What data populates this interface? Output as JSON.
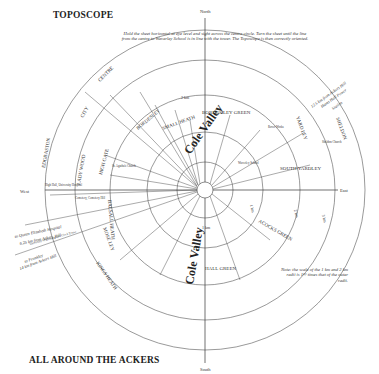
{
  "title": "TOPOSCOPE",
  "footer_title": "ALL AROUND THE ACKERS",
  "instructions": "Hold the sheet horizontal at eye level and sight across the centre circle. Turn the sheet until the line from the centre to Waverley School is in line with the tower. The Toposcope is then correctly oriented.",
  "note": "Note: the scale of the 1 km and 2 km radii is 1½ times that of the outer radii.",
  "compass": {
    "north": "North",
    "south": "South",
    "east": "East",
    "west": "West"
  },
  "rings": {
    "r1": "1 km",
    "r2": "2 km",
    "r3": "3 km",
    "r4": "4 km"
  },
  "districts": {
    "centre": "CENTRE",
    "city": "CITY",
    "edgbaston": "EDGBASTON",
    "ladywood": "LADY WOOD",
    "highgate": "HIGH GATE",
    "balsall_heath": "BALSALL HEATH",
    "moseley": "MOSE LEY",
    "kings_heath": "KINGS HEATH",
    "digbeth": "DIGBETH",
    "bordesley_green": "BORDES LEY GREEN",
    "small_heath": "SMALL HEATH",
    "bordesley": "BORDESLEY",
    "yardley": "YARD LEY",
    "south_yardley": "SOUTH YARDLEY",
    "sheldon": "SHELDON",
    "acocks_green": "ACOCKS GREEN",
    "hall_green": "HALL GREEN"
  },
  "river_labels": [
    "Cole Valley",
    "Cole Valley"
  ],
  "pointers": {
    "qe_hospital": [
      "to Queen Elizabeth Hospital",
      "6.25 km from Ackers Hill"
    ],
    "frankley": [
      "to Frankley",
      "14 km from Ackers Hill"
    ],
    "hams_hall": [
      "12.5 km from Ackers Hill",
      "Hams Hall Power",
      "Station"
    ]
  },
  "landmarks": {
    "high_hall": "High Hall, University Hospital",
    "cemetery": "Cemetery, Cemetery Hill",
    "brum_univ": "University of Birmingham Clock Tower",
    "st_agathas": "St. Agatha's Church",
    "st_marys": "St. Mary's Church",
    "waverley": "Waverley School",
    "st_barnabas": "St. Barnabas Church",
    "rover_works": "Rover Works",
    "sheldon_ch": "Sheldon Church"
  }
}
